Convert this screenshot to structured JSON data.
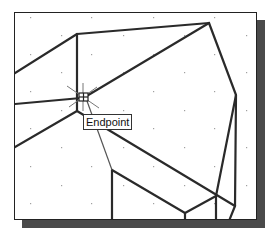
{
  "canvas": {
    "background": "#ffffff",
    "frame_color": "#222222",
    "shadow_color": "#4a4a4a",
    "line_color": "#2a2a2a",
    "grid_dot_color": "#a0a0a0"
  },
  "osnap": {
    "marker": "endpoint-marker-icon",
    "tooltip_label": "Endpoint"
  }
}
